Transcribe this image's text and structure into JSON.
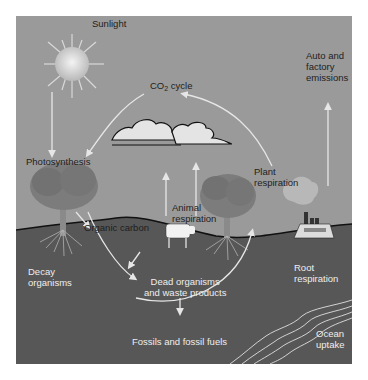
{
  "diagram": {
    "colors": {
      "sky": "#9a9a9a",
      "ground": "#555555",
      "arrow": "#e6e6e6",
      "cloud": "#e4e4e4",
      "tree": "#7c7c7c"
    },
    "labels": {
      "sunlight": "Sunlight",
      "co2_prefix": "CO",
      "co2_sub": "2",
      "co2_suffix": " cycle",
      "auto_emissions": "Auto and\nfactory\nemissions",
      "photosynthesis": "Photosynthesis",
      "plant_respiration": "Plant\nrespiration",
      "animal_respiration": "Animal\nrespiration",
      "organic_carbon": "Organic carbon",
      "decay_organisms": "Decay\norganisms",
      "dead_organisms": "Dead organisms\nand waste products",
      "root_respiration": "Root\nrespiration",
      "fossils": "Fossils and fossil fuels",
      "ocean_uptake": "Ocean\nuptake"
    },
    "icons": [
      "sun-icon",
      "cloud-icon",
      "tree-icon",
      "cow-icon",
      "factory-icon",
      "ocean-wave-icon"
    ]
  }
}
